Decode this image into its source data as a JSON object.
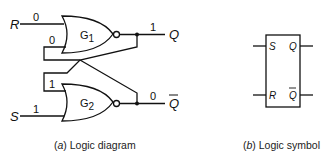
{
  "diagram": {
    "inputs": {
      "R": "R",
      "S": "S"
    },
    "outputs": {
      "Q": "Q",
      "Qbar": "Q"
    },
    "gates": [
      {
        "id": "G1",
        "label": "G",
        "sub": "1"
      },
      {
        "id": "G2",
        "label": "G",
        "sub": "2"
      }
    ],
    "values": {
      "R": "0",
      "S": "1",
      "Q": "1",
      "Qbar": "0",
      "g1_feedback": "0",
      "g2_feedback": "1"
    },
    "symbol": {
      "S": "S",
      "R": "R",
      "Q": "Q",
      "Qbar": "Q"
    }
  },
  "captions": {
    "a_prefix": "(",
    "a_letter": "a",
    "a_text": ") Logic diagram",
    "b_prefix": "(",
    "b_letter": "b",
    "b_text": ") Logic symbol"
  }
}
